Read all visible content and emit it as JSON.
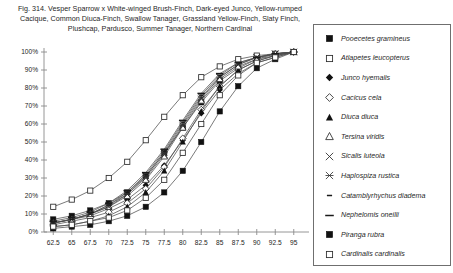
{
  "caption": {
    "line1": "Fig. 314.  Vesper Sparrow x White-winged Brush-Finch, Dark-eyed Junco, Yellow-rumped",
    "line2": "Cacique, Common Diuca-Finch, Swallow Tanager, Grassland Yellow-Finch, Slaty Finch,",
    "line3": "Plushcap, Pardusco, Summer Tanager, Northern Cardinal"
  },
  "chart_data": {
    "type": "line",
    "xlabel": "",
    "ylabel": "",
    "xlim": [
      61.25,
      96.25
    ],
    "ylim": [
      0,
      100
    ],
    "grid": false,
    "legend_position": "right",
    "x_tick_labels": [
      "62.5",
      "65",
      "67.5",
      "70",
      "72.5",
      "75",
      "77.5",
      "80",
      "82.5",
      "85",
      "87.5",
      "90",
      "92.5",
      "95"
    ],
    "x": [
      62.5,
      65,
      67.5,
      70,
      72.5,
      75,
      77.5,
      80,
      82.5,
      85,
      87.5,
      90,
      92.5,
      95
    ],
    "y_tick_labels": [
      "0%",
      "10%",
      "20%",
      "30%",
      "40%",
      "50%",
      "60%",
      "70%",
      "80%",
      "90%",
      "100%"
    ],
    "y_ticks": [
      0,
      10,
      20,
      30,
      40,
      50,
      60,
      70,
      80,
      90,
      100
    ],
    "series": [
      {
        "name": "Pooecetes gramineus",
        "marker": "filled-square",
        "values": [
          7,
          9,
          12,
          16,
          22,
          31,
          44,
          58,
          72,
          84,
          91,
          96,
          98,
          100
        ]
      },
      {
        "name": "Atlapetes leucopterus",
        "marker": "open-square",
        "values": [
          14,
          18,
          23,
          30,
          39,
          51,
          64,
          76,
          86,
          92,
          96,
          98,
          99,
          100
        ]
      },
      {
        "name": "Junco hyemalis",
        "marker": "filled-diamond",
        "values": [
          5,
          7,
          9,
          13,
          18,
          26,
          37,
          51,
          66,
          79,
          88,
          94,
          97,
          100
        ]
      },
      {
        "name": "Cacicus cela",
        "marker": "open-diamond",
        "values": [
          4,
          6,
          8,
          11,
          16,
          24,
          36,
          52,
          68,
          81,
          90,
          95,
          98,
          100
        ]
      },
      {
        "name": "Diuca diuca",
        "marker": "filled-triangle",
        "values": [
          3,
          4,
          6,
          9,
          14,
          22,
          34,
          50,
          67,
          81,
          90,
          95,
          98,
          100
        ]
      },
      {
        "name": "Tersina viridis",
        "marker": "open-triangle",
        "values": [
          5,
          7,
          10,
          14,
          20,
          29,
          42,
          58,
          73,
          85,
          92,
          96,
          99,
          100
        ]
      },
      {
        "name": "Sicalis luteola",
        "marker": "x-cross",
        "values": [
          5,
          7,
          10,
          14,
          21,
          30,
          43,
          59,
          74,
          86,
          93,
          97,
          99,
          100
        ]
      },
      {
        "name": "Haplospiza rustica",
        "marker": "star-cross",
        "values": [
          5,
          7,
          10,
          15,
          21,
          31,
          44,
          60,
          75,
          86,
          93,
          97,
          99,
          100
        ]
      },
      {
        "name": "Catamblyrhychus diadema",
        "marker": "short-dash",
        "values": [
          5,
          7,
          10,
          15,
          22,
          32,
          45,
          61,
          76,
          87,
          94,
          97,
          99,
          100
        ]
      },
      {
        "name": "Nephelomis oneilli",
        "marker": "long-dash",
        "values": [
          6,
          8,
          11,
          16,
          23,
          33,
          46,
          62,
          77,
          88,
          94,
          97,
          99,
          100
        ]
      },
      {
        "name": "Piranga rubra",
        "marker": "filled-square",
        "values": [
          2,
          3,
          4,
          6,
          9,
          14,
          22,
          34,
          50,
          67,
          81,
          91,
          96,
          100
        ]
      },
      {
        "name": "Cardinalis cardinalis",
        "marker": "open-square",
        "values": [
          3,
          4,
          6,
          8,
          12,
          19,
          29,
          44,
          60,
          76,
          87,
          94,
          97,
          100
        ]
      }
    ]
  },
  "legend": {
    "items": [
      {
        "label": "Pooecetes gramineus",
        "marker": "filled-square"
      },
      {
        "label": "Atlapetes leucopterus",
        "marker": "open-square"
      },
      {
        "label": "Junco hyemalis",
        "marker": "filled-diamond"
      },
      {
        "label": "Cacicus cela",
        "marker": "open-diamond"
      },
      {
        "label": "Diuca diuca",
        "marker": "filled-triangle"
      },
      {
        "label": "Tersina viridis",
        "marker": "open-triangle"
      },
      {
        "label": "Sicalis luteola",
        "marker": "x-cross"
      },
      {
        "label": "Haplospiza rustica",
        "marker": "star-cross"
      },
      {
        "label": "Catamblyrhychus diadema",
        "marker": "short-dash"
      },
      {
        "label": "Nephelomis oneilli",
        "marker": "long-dash"
      },
      {
        "label": "Piranga rubra",
        "marker": "filled-square"
      },
      {
        "label": "Cardinalis cardinalis",
        "marker": "open-square"
      }
    ]
  },
  "colors": {
    "line": "#4d4d4d",
    "marker_fill": "#111111",
    "marker_open": "#ffffff",
    "axis": "#8a8a8a",
    "text": "#1f1f1f",
    "legend_border": "#6f6f6f"
  }
}
